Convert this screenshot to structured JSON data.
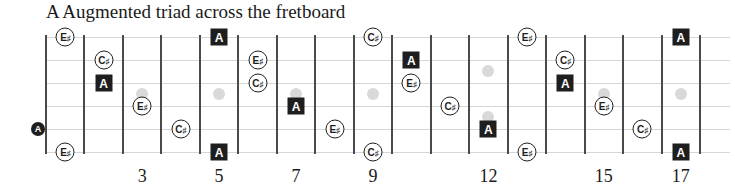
{
  "title": "A Augmented triad across the fretboard",
  "geometry": {
    "nut_x": 46,
    "fret_spacing": 38.47,
    "num_frets": 17,
    "string_y": [
      37,
      60,
      83,
      106,
      129,
      152
    ],
    "top_y": 35,
    "bottom_y": 154
  },
  "colors": {
    "root_fill": "#1e1e1e",
    "tone_outline": "#1e1e1e",
    "string": "#d6d6d6",
    "fret": "#4a4a4a",
    "inlay": "#d9d9d9"
  },
  "fret_numbers": [
    {
      "fret": 3,
      "label": "3"
    },
    {
      "fret": 5,
      "label": "5"
    },
    {
      "fret": 7,
      "label": "7"
    },
    {
      "fret": 9,
      "label": "9"
    },
    {
      "fret": 12,
      "label": "12"
    },
    {
      "fret": 15,
      "label": "15"
    },
    {
      "fret": 17,
      "label": "17"
    }
  ],
  "inlays": [
    {
      "fret": 3,
      "y": 94
    },
    {
      "fret": 5,
      "y": 94
    },
    {
      "fret": 7,
      "y": 94
    },
    {
      "fret": 9,
      "y": 94
    },
    {
      "fret": 12,
      "y": 71
    },
    {
      "fret": 12,
      "y": 117
    },
    {
      "fret": 15,
      "y": 94
    },
    {
      "fret": 17,
      "y": 94
    }
  ],
  "legend": {
    "root": "A",
    "third": "C♯",
    "aug_fifth": "E♯"
  },
  "notes": [
    {
      "string": 0,
      "fret": 1,
      "name": "E",
      "acc": "♯",
      "type": "tone"
    },
    {
      "string": 0,
      "fret": 5,
      "name": "A",
      "acc": "",
      "type": "root"
    },
    {
      "string": 0,
      "fret": 9,
      "name": "C",
      "acc": "♯",
      "type": "tone"
    },
    {
      "string": 0,
      "fret": 13,
      "name": "E",
      "acc": "♯",
      "type": "tone"
    },
    {
      "string": 0,
      "fret": 17,
      "name": "A",
      "acc": "",
      "type": "root"
    },
    {
      "string": 1,
      "fret": 2,
      "name": "C",
      "acc": "♯",
      "type": "tone"
    },
    {
      "string": 1,
      "fret": 6,
      "name": "E",
      "acc": "♯",
      "type": "tone"
    },
    {
      "string": 1,
      "fret": 10,
      "name": "A",
      "acc": "",
      "type": "root"
    },
    {
      "string": 1,
      "fret": 14,
      "name": "C",
      "acc": "♯",
      "type": "tone"
    },
    {
      "string": 2,
      "fret": 2,
      "name": "A",
      "acc": "",
      "type": "root"
    },
    {
      "string": 2,
      "fret": 6,
      "name": "C",
      "acc": "♯",
      "type": "tone"
    },
    {
      "string": 2,
      "fret": 10,
      "name": "E",
      "acc": "♯",
      "type": "tone"
    },
    {
      "string": 2,
      "fret": 14,
      "name": "A",
      "acc": "",
      "type": "root"
    },
    {
      "string": 3,
      "fret": 3,
      "name": "E",
      "acc": "♯",
      "type": "tone"
    },
    {
      "string": 3,
      "fret": 7,
      "name": "A",
      "acc": "",
      "type": "root"
    },
    {
      "string": 3,
      "fret": 11,
      "name": "C",
      "acc": "♯",
      "type": "tone"
    },
    {
      "string": 3,
      "fret": 15,
      "name": "E",
      "acc": "♯",
      "type": "tone"
    },
    {
      "string": 4,
      "fret": 0,
      "name": "A",
      "acc": "",
      "type": "open"
    },
    {
      "string": 4,
      "fret": 4,
      "name": "C",
      "acc": "♯",
      "type": "tone"
    },
    {
      "string": 4,
      "fret": 8,
      "name": "E",
      "acc": "♯",
      "type": "tone"
    },
    {
      "string": 4,
      "fret": 12,
      "name": "A",
      "acc": "",
      "type": "root"
    },
    {
      "string": 4,
      "fret": 16,
      "name": "C",
      "acc": "♯",
      "type": "tone"
    },
    {
      "string": 5,
      "fret": 1,
      "name": "E",
      "acc": "♯",
      "type": "tone"
    },
    {
      "string": 5,
      "fret": 5,
      "name": "A",
      "acc": "",
      "type": "root"
    },
    {
      "string": 5,
      "fret": 9,
      "name": "C",
      "acc": "♯",
      "type": "tone"
    },
    {
      "string": 5,
      "fret": 13,
      "name": "E",
      "acc": "♯",
      "type": "tone"
    },
    {
      "string": 5,
      "fret": 17,
      "name": "A",
      "acc": "",
      "type": "root"
    }
  ]
}
